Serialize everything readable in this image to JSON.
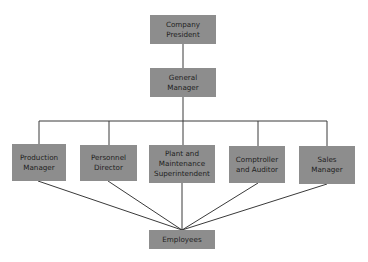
{
  "chart": {
    "nodes": {
      "president": {
        "label": "Company\nPresident"
      },
      "general_manager": {
        "label": "General\nManager"
      },
      "production_manager": {
        "label": "Production\nManager"
      },
      "personnel_director": {
        "label": "Personnel\nDirector"
      },
      "plant_superintendent": {
        "label": "Plant and\nMaintenance\nSuperintendent"
      },
      "comptroller": {
        "label": "Comptroller\nand Auditor"
      },
      "sales_manager": {
        "label": "Sales\nManager"
      },
      "employees": {
        "label": "Employees"
      }
    },
    "edges": [
      [
        "Company President",
        "General Manager"
      ],
      [
        "General Manager",
        "Production Manager"
      ],
      [
        "General Manager",
        "Personnel Director"
      ],
      [
        "General Manager",
        "Plant and Maintenance Superintendent"
      ],
      [
        "General Manager",
        "Comptroller and Auditor"
      ],
      [
        "General Manager",
        "Sales Manager"
      ],
      [
        "Production Manager",
        "Employees"
      ],
      [
        "Personnel Director",
        "Employees"
      ],
      [
        "Plant and Maintenance Superintendent",
        "Employees"
      ],
      [
        "Comptroller and Auditor",
        "Employees"
      ],
      [
        "Sales Manager",
        "Employees"
      ]
    ],
    "colors": {
      "node_fill": "#8d8d8d",
      "node_text": "#1e1e1e",
      "line": "#3a3a3a",
      "background": "#ffffff"
    }
  }
}
